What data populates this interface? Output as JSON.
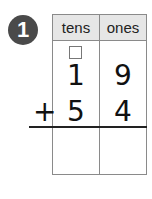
{
  "problem": {
    "number": "1",
    "columns": [
      "tens",
      "ones"
    ],
    "carry_box": "",
    "addend1": {
      "tens": "1",
      "ones": "9"
    },
    "operator": "+",
    "addend2": {
      "tens": "5",
      "ones": "4"
    },
    "answer": {
      "tens": "",
      "ones": ""
    }
  }
}
